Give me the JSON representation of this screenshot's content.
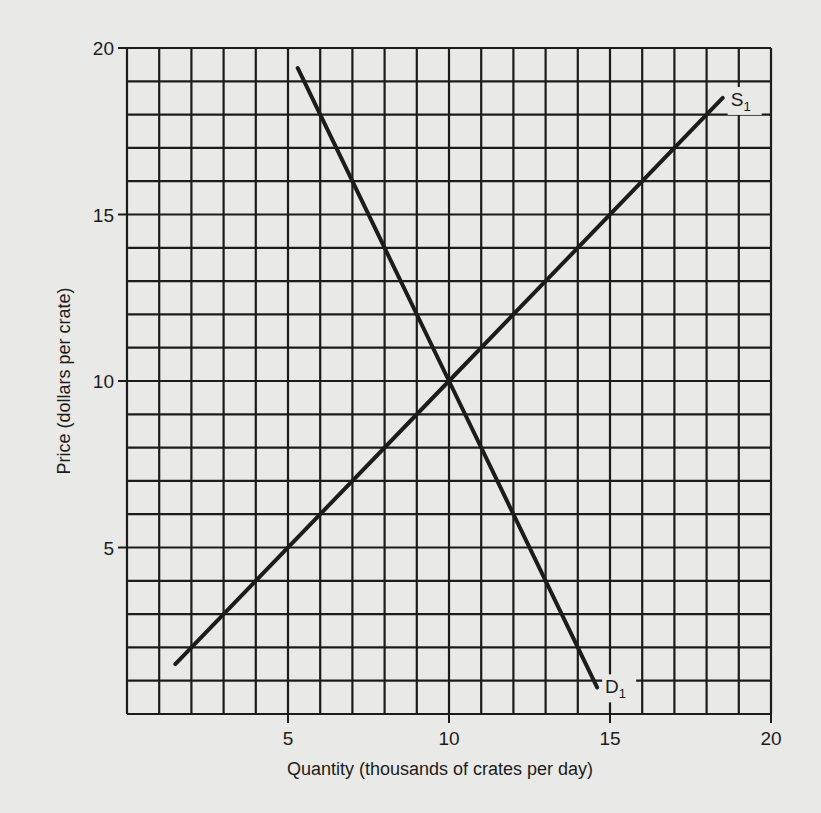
{
  "chart_data": {
    "type": "line",
    "title": "",
    "xlabel": "Quantity (thousands of crates per day)",
    "ylabel": "Price (dollars per crate)",
    "xlim": [
      0,
      20
    ],
    "ylim": [
      0,
      20
    ],
    "x_ticks": [
      5,
      10,
      15,
      20
    ],
    "y_ticks": [
      5,
      10,
      15,
      20
    ],
    "x_tick_labels": [
      "5",
      "10",
      "15",
      "20"
    ],
    "y_tick_labels": [
      "5",
      "10",
      "15",
      "20"
    ],
    "grid": true,
    "grid_step": 1,
    "legend": "none",
    "series": [
      {
        "name": "S1",
        "label_main": "S",
        "label_sub": "1",
        "kind": "supply",
        "points": [
          [
            1.5,
            1.5
          ],
          [
            10,
            10
          ],
          [
            18.5,
            18.5
          ]
        ]
      },
      {
        "name": "D1",
        "label_main": "D",
        "label_sub": "1",
        "kind": "demand",
        "points": [
          [
            5.3,
            19.4
          ],
          [
            10,
            10
          ],
          [
            14.6,
            0.8
          ]
        ]
      }
    ],
    "annotations": [
      {
        "text": "Equilibrium intersection",
        "x": 10,
        "y": 10,
        "visible_text": false
      }
    ]
  },
  "colors": {
    "background": "#e9e9e7",
    "ink": "#1c1c1c"
  },
  "layout": {
    "plot_left": 127,
    "plot_top": 48,
    "plot_right": 771,
    "plot_bottom": 714
  }
}
